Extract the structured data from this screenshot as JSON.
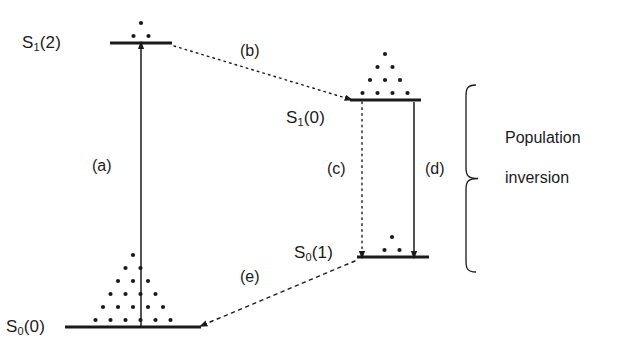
{
  "figure": {
    "kind": "energy-level-diagram",
    "background_color": "#ffffff",
    "ink_color": "#1a1a1a"
  },
  "levels": [
    {
      "id": "s1-2",
      "label_text": "S",
      "label_sub": "1",
      "label_paren": "(2)",
      "label_full": "S1(2)",
      "label_x": 22,
      "label_y": 33,
      "line_x1": 110,
      "line_x2": 172,
      "line_y": 43,
      "population_dots": 3,
      "dot_rows": [
        1,
        2
      ],
      "dot_center_x": 141,
      "dot_bottom_y": 36
    },
    {
      "id": "s1-0",
      "label_text": "S",
      "label_sub": "1",
      "label_paren": "(0)",
      "label_full": "S1(0)",
      "label_x": 286,
      "label_y": 108,
      "line_x1": 350,
      "line_x2": 421,
      "line_y": 100,
      "population_dots": 10,
      "dot_rows": [
        1,
        2,
        3,
        4
      ],
      "dot_center_x": 385,
      "dot_bottom_y": 93
    },
    {
      "id": "s0-1",
      "label_text": "S",
      "label_sub": "0",
      "label_paren": "(1)",
      "label_full": "S0(1)",
      "label_x": 294,
      "label_y": 243,
      "line_x1": 357,
      "line_x2": 429,
      "line_y": 257,
      "population_dots": 3,
      "dot_rows": [
        1,
        2
      ],
      "dot_center_x": 392,
      "dot_bottom_y": 250
    },
    {
      "id": "s0-0",
      "label_text": "S",
      "label_sub": "0",
      "label_paren": "(0)",
      "label_full": "S0(0)",
      "label_x": 6,
      "label_y": 317,
      "line_x1": 65,
      "line_x2": 201,
      "line_y": 327,
      "population_dots": 21,
      "dot_rows": [
        1,
        2,
        3,
        4,
        5,
        6
      ],
      "dot_center_x": 133,
      "dot_bottom_y": 320
    }
  ],
  "transitions": [
    {
      "id": "a",
      "label": "(a)",
      "label_x": 92,
      "label_y": 157,
      "style": "solid",
      "from": "S0(0)",
      "to": "S1(2)",
      "x1": 141,
      "y1": 327,
      "x2": 141,
      "y2": 45,
      "arrowhead": "end"
    },
    {
      "id": "b",
      "label": "(b)",
      "label_x": 240,
      "label_y": 42,
      "style": "dotted",
      "from": "S1(2)",
      "to": "S1(0)",
      "x1": 174,
      "y1": 46,
      "x2": 349,
      "y2": 99,
      "arrowhead": "end"
    },
    {
      "id": "c",
      "label": "(c)",
      "label_x": 327,
      "label_y": 160,
      "style": "dotted",
      "from": "S1(0)",
      "to": "S0(1)",
      "x1": 362,
      "y1": 102,
      "x2": 362,
      "y2": 255,
      "arrowhead": "end"
    },
    {
      "id": "d",
      "label": "(d)",
      "label_x": 425,
      "label_y": 160,
      "style": "solid",
      "from": "S1(0)",
      "to": "S0(1)",
      "x1": 414,
      "y1": 102,
      "x2": 414,
      "y2": 255,
      "arrowhead": "end"
    },
    {
      "id": "e",
      "label": "(e)",
      "label_x": 240,
      "label_y": 268,
      "style": "dashed",
      "from": "S0(1)",
      "to": "S0(0)",
      "x1": 355,
      "y1": 261,
      "x2": 203,
      "y2": 325,
      "arrowhead": "end"
    }
  ],
  "annotation": {
    "brace": {
      "x": 466,
      "y_top": 85,
      "y_bottom": 272,
      "tip_x": 478
    },
    "label_line1": "Population",
    "label_line2": "inversion",
    "label_x": 505,
    "label_y": 158
  }
}
